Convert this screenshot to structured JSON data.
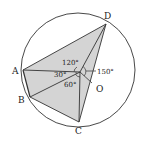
{
  "diagram": {
    "type": "circle-geometry",
    "colors": {
      "stroke": "#333333",
      "fill": "#d4d4d4",
      "background": "#ffffff",
      "text": "#222222"
    },
    "circle": {
      "cx": 78,
      "cy": 70,
      "r": 57
    },
    "points": {
      "D": {
        "label": "D",
        "x": 106,
        "y": 24
      },
      "A": {
        "label": "A",
        "x": 23,
        "y": 70
      },
      "B": {
        "label": "B",
        "x": 30,
        "y": 97
      },
      "C": {
        "label": "C",
        "x": 79,
        "y": 122
      },
      "P": {
        "label": "",
        "x": 80,
        "y": 72
      },
      "O": {
        "label": "O",
        "x": 92,
        "y": 82
      }
    },
    "point_labels": {
      "A": "A",
      "B": "B",
      "C": "C",
      "D": "D",
      "O": "O"
    },
    "angle_labels": {
      "a120": "120°",
      "a30": "30°",
      "a60": "60°",
      "a150": "150°"
    }
  }
}
